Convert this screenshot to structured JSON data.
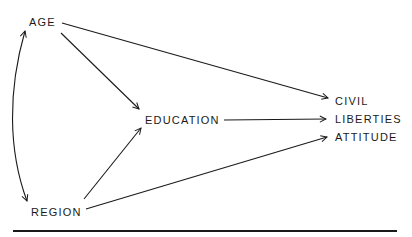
{
  "diagram": {
    "type": "path-diagram",
    "nodes": [
      {
        "id": "age",
        "label": "AGE"
      },
      {
        "id": "region",
        "label": "REGION"
      },
      {
        "id": "education",
        "label": "EDUCATION"
      },
      {
        "id": "civil_liberties_attitude",
        "label_lines": [
          "CIVIL",
          "LIBERTIES",
          "ATTITUDE"
        ]
      }
    ],
    "edges": [
      {
        "from": "age",
        "to": "civil_liberties_attitude",
        "type": "directed"
      },
      {
        "from": "age",
        "to": "education",
        "type": "directed"
      },
      {
        "from": "region",
        "to": "education",
        "type": "directed"
      },
      {
        "from": "region",
        "to": "civil_liberties_attitude",
        "type": "directed"
      },
      {
        "from": "education",
        "to": "civil_liberties_attitude",
        "type": "directed"
      },
      {
        "from": "age",
        "to": "region",
        "type": "bidirectional-curved"
      }
    ],
    "line_color": "#1a1a1a"
  }
}
